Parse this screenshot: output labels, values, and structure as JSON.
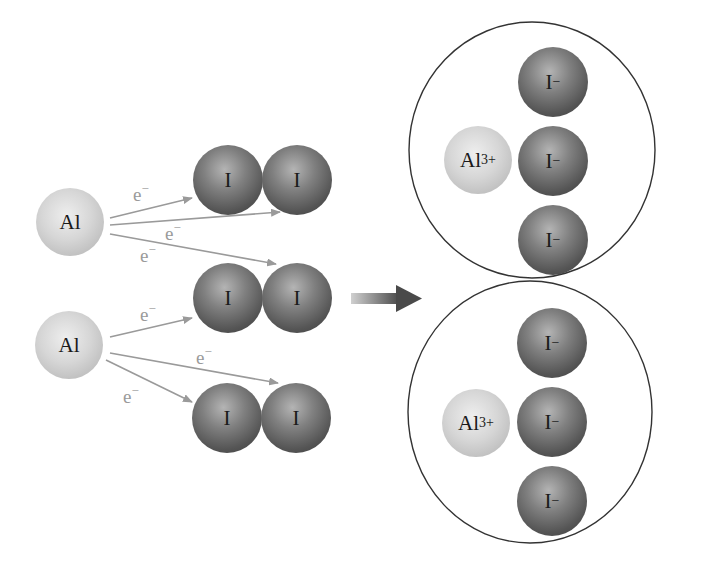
{
  "diagram": {
    "colors": {
      "aluminum": "#d0d0d0",
      "iodine": "#5a5a5a",
      "electron_arrow": "#9a9a9a",
      "reaction_arrow": "#555555",
      "outline": "#333333"
    },
    "reactants": {
      "al_atoms": [
        {
          "label": "Al"
        },
        {
          "label": "Al"
        }
      ],
      "i2_molecules": [
        {
          "atoms": [
            "I",
            "I"
          ]
        },
        {
          "atoms": [
            "I",
            "I"
          ]
        },
        {
          "atoms": [
            "I",
            "I"
          ]
        }
      ],
      "electron_labels": [
        {
          "symbol": "e",
          "charge": "−"
        },
        {
          "symbol": "e",
          "charge": "−"
        },
        {
          "symbol": "e",
          "charge": "−"
        },
        {
          "symbol": "e",
          "charge": "−"
        },
        {
          "symbol": "e",
          "charge": "−"
        },
        {
          "symbol": "e",
          "charge": "−"
        }
      ]
    },
    "products": [
      {
        "cation": {
          "symbol": "Al",
          "charge": "3+"
        },
        "anions": [
          {
            "symbol": "I",
            "charge": "−"
          },
          {
            "symbol": "I",
            "charge": "−"
          },
          {
            "symbol": "I",
            "charge": "−"
          }
        ]
      },
      {
        "cation": {
          "symbol": "Al",
          "charge": "3+"
        },
        "anions": [
          {
            "symbol": "I",
            "charge": "−"
          },
          {
            "symbol": "I",
            "charge": "−"
          },
          {
            "symbol": "I",
            "charge": "−"
          }
        ]
      }
    ]
  }
}
